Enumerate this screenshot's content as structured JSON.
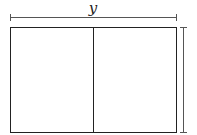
{
  "diagram": {
    "type": "rectangle-split",
    "labels": {
      "top_dimension": "y"
    },
    "shape": {
      "outer_rect": {
        "x": 10,
        "y": 27,
        "width": 166,
        "height": 106
      },
      "divider_x": 93,
      "parts": 2
    },
    "dimensions": [
      {
        "side": "top",
        "label": "y"
      },
      {
        "side": "right",
        "label": ""
      }
    ],
    "colors": {
      "stroke": "#222222",
      "dim_stroke": "#555555",
      "background": "#ffffff"
    }
  }
}
